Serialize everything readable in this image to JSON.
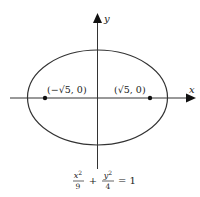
{
  "diagram": {
    "type": "ellipse-with-foci",
    "axes": {
      "x_label": "x",
      "y_label": "y"
    },
    "ellipse": {
      "a_squared": 9,
      "b_squared": 4,
      "stroke_color": "#333333"
    },
    "foci": [
      {
        "label": "(−√5, 0)",
        "sign": "−",
        "radical": "√5",
        "coord_rest": ", 0)"
      },
      {
        "label": "(√5, 0)",
        "sign": "",
        "radical": "√5",
        "coord_rest": ", 0)"
      }
    ],
    "equation": {
      "text": "x²/9 + y²/4 = 1",
      "term1_num": "x",
      "term1_exp": "2",
      "term1_den": "9",
      "plus": "+",
      "term2_num": "y",
      "term2_exp": "2",
      "term2_den": "4",
      "equals": "= 1"
    },
    "colors": {
      "line": "#333333",
      "text": "#222222",
      "background": "#ffffff"
    }
  }
}
